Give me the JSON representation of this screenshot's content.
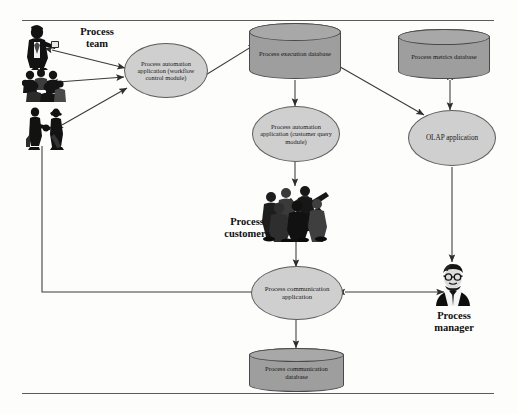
{
  "diagram": {
    "colors": {
      "ellipse_fill": "#cfcfcf",
      "cylinder_fill": "#9e9e9e",
      "cylinder_top_fill": "#a8a8a8",
      "outline": "#4a4a4a",
      "arrow": "#3a3a3a",
      "frame_rule": "#5a5a5a",
      "text": "#101010"
    },
    "frame": {
      "top_rule": "horizontal rule",
      "bottom_rule": "horizontal rule"
    },
    "nodes": {
      "process_team_caption": "Process\nteam",
      "workflow_app": "Process automation application (workflow control module)",
      "execution_db": "Process execution database",
      "metrics_db": "Process metrics database",
      "query_app": "Process automation application (customer query module)",
      "olap_app": "OLAP application",
      "customers_caption": "Process\ncustomers",
      "communication_app": "Process communication application",
      "communication_db": "Process communication database",
      "manager_caption": "Process\nmanager"
    },
    "figures": {
      "team_member_single": "businessman-with-tablet-icon",
      "team_member_group": "group-of-people-icon",
      "team_member_handshake": "handshake-pair-icon",
      "customers_crowd": "crowd-of-customers-icon",
      "manager_portrait": "manager-portrait-icon"
    },
    "connectors": [
      {
        "name": "team-member-1-to-workflow-app",
        "type": "bidirectional"
      },
      {
        "name": "team-member-2-to-workflow-app",
        "type": "bidirectional"
      },
      {
        "name": "team-member-3-to-workflow-app",
        "type": "bidirectional"
      },
      {
        "name": "workflow-app-to-execution-db",
        "type": "bidirectional"
      },
      {
        "name": "execution-db-to-query-app",
        "type": "unidirectional"
      },
      {
        "name": "execution-db-to-olap-app",
        "type": "unidirectional"
      },
      {
        "name": "metrics-db-to-olap-app",
        "type": "bidirectional"
      },
      {
        "name": "query-app-to-customers",
        "type": "unidirectional"
      },
      {
        "name": "customers-to-communication-app",
        "type": "bidirectional"
      },
      {
        "name": "communication-app-to-communication-db",
        "type": "bidirectional"
      },
      {
        "name": "communication-app-to-manager",
        "type": "bidirectional"
      },
      {
        "name": "olap-app-to-manager",
        "type": "unidirectional"
      },
      {
        "name": "communication-app-to-team-member-3",
        "type": "unidirectional-elbow"
      }
    ]
  }
}
